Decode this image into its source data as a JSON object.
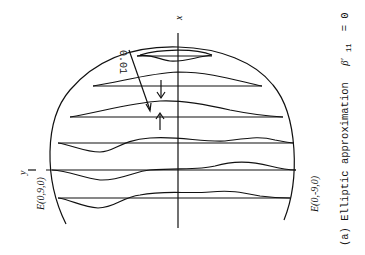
{
  "figure": {
    "caption": "(a) Elliptic approximation",
    "caption_symbol": "β′",
    "caption_subscript": "11",
    "caption_equation": "= 0",
    "axis_x_label": "x",
    "axis_y_label": "y",
    "point_top_label": "E(0,9,0)",
    "point_bottom_label": "E(0,-9,0)",
    "scale_label": "0.01",
    "line_color": "#111111",
    "background": "#ffffff",
    "orientation": "rotated 90° counter-clockwise"
  }
}
